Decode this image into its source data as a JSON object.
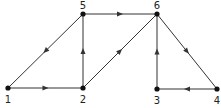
{
  "diagram": {
    "type": "directed-graph",
    "nodes": [
      {
        "id": "1",
        "label": "1",
        "x": 8,
        "y": 88,
        "lx": 8,
        "ly": 103
      },
      {
        "id": "2",
        "label": "2",
        "x": 83,
        "y": 88,
        "lx": 83,
        "ly": 103
      },
      {
        "id": "5",
        "label": "5",
        "x": 83,
        "y": 14,
        "lx": 83,
        "ly": 9
      },
      {
        "id": "6",
        "label": "6",
        "x": 157,
        "y": 14,
        "lx": 157,
        "ly": 9
      },
      {
        "id": "3",
        "label": "3",
        "x": 157,
        "y": 89,
        "lx": 157,
        "ly": 104
      },
      {
        "id": "4",
        "label": "4",
        "x": 217,
        "y": 89,
        "lx": 217,
        "ly": 104
      }
    ],
    "edges": [
      {
        "from": "5",
        "to": "1"
      },
      {
        "from": "1",
        "to": "2"
      },
      {
        "from": "2",
        "to": "5"
      },
      {
        "from": "5",
        "to": "6"
      },
      {
        "from": "2",
        "to": "6"
      },
      {
        "from": "3",
        "to": "6"
      },
      {
        "from": "6",
        "to": "4"
      },
      {
        "from": "4",
        "to": "3"
      }
    ],
    "colors": {
      "stroke": "#333333",
      "node": "#111111"
    }
  }
}
